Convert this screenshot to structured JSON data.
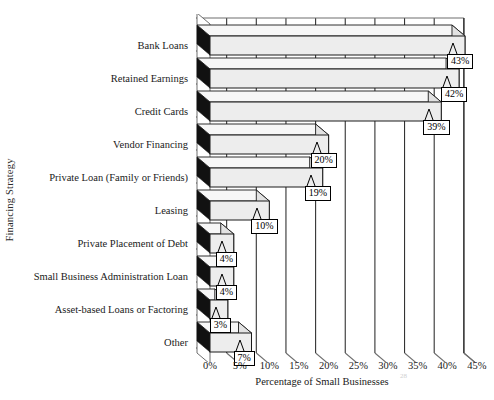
{
  "chart_data": {
    "type": "bar",
    "orientation": "horizontal",
    "title": "",
    "xlabel": "Percentage of Small Businesses",
    "ylabel": "Financing Strategy",
    "categories": [
      "Bank Loans",
      "Retained Earnings",
      "Credit Cards",
      "Vendor Financing",
      "Private Loan (Family or Friends)",
      "Leasing",
      "Private Placement of Debt",
      "Small Business Administration Loan",
      "Asset-based Loans or Factoring",
      "Other"
    ],
    "values": [
      43,
      42,
      39,
      20,
      19,
      10,
      4,
      4,
      3,
      7
    ],
    "data_labels": [
      "43%",
      "42%",
      "39%",
      "20%",
      "19%",
      "10%",
      "4%",
      "4%",
      "3%",
      "7%"
    ],
    "xlim": [
      0,
      45
    ],
    "xticks": [
      0,
      5,
      10,
      15,
      20,
      25,
      30,
      35,
      40,
      45
    ],
    "xtick_labels": [
      "0%",
      "5%",
      "10%",
      "15%",
      "20%",
      "25%",
      "30%",
      "35%",
      "40%",
      "45%"
    ],
    "grid": true,
    "grid_axis": "x",
    "legend": false,
    "style": "3d",
    "colors": {
      "bar_face": "#ededed",
      "bar_top": "#f7f7f7",
      "bar_side": "#111111",
      "axis_line": "#6e6e6e",
      "grid_line": "#333333",
      "background": "#ffffff",
      "text": "#1a1a1a"
    }
  },
  "artifact": {
    "scan_smudge": "28"
  }
}
